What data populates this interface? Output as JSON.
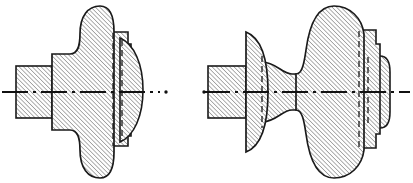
{
  "sheet": {
    "title": "Sectioned shaft assembly — two orthographic half-section views",
    "width": 413,
    "height": 183,
    "background_color": "#ffffff"
  },
  "style": {
    "outline_color": "#1a1a1a",
    "outline_width": 1.6,
    "hidden_line_color": "#1a1a1a",
    "hidden_line_width": 1.3,
    "hidden_line_dash": "6 4",
    "centerline_color": "#111111",
    "centerline_width": 2.2,
    "centerline_dash": "26 5 3 5",
    "hatch_color": "#3c3c3c",
    "hatch_width": 0.8,
    "hatch_spacing": 3.1,
    "hatch_angle_deg": 45,
    "fill_color": "#fefefe"
  },
  "figures": [
    {
      "id": "figure-left",
      "label": "Left view — shaft with round boss and end flange",
      "centerline": {
        "y": 92,
        "x_start": 2,
        "x_end": 160,
        "tail_dot_x": 166,
        "tail_dot_x2": 204
      },
      "parts": [
        {
          "name": "left-shaft-block",
          "kind": "rectangle",
          "description": "Rectangular shaft stub at left, sectioned",
          "x": 16,
          "y": 66,
          "width": 36,
          "height": 52
        },
        {
          "name": "central-round-boss",
          "kind": "lobed-boss",
          "description": "Large rounded central mass with concave fillets top and bottom",
          "x_left": 52,
          "x_right": 114,
          "y_top": 6,
          "y_bottom": 178
        },
        {
          "name": "right-step-block",
          "kind": "stepped-rectangle",
          "description": "Narrow stepped rectangular collar at right with hidden edges",
          "x": 114,
          "y": 32,
          "width": 16,
          "height": 114
        },
        {
          "name": "end-flange-lens",
          "kind": "lens-disc",
          "description": "Lens/disc shaped end flange overlapping the step block",
          "x_left": 118,
          "x_right": 143,
          "y_top": 38,
          "y_bottom": 142
        }
      ],
      "hidden_lines": [
        {
          "name": "hidden-edge-a",
          "x": 113,
          "y_top": 33,
          "y_bottom": 146
        },
        {
          "name": "hidden-edge-b",
          "x": 122,
          "y_top": 40,
          "y_bottom": 140
        }
      ]
    },
    {
      "id": "figure-right",
      "label": "Right view — shaft with D-flange, waisted neck and large end mass",
      "centerline": {
        "y": 92,
        "x_start": 204,
        "x_end": 410,
        "tail_dot_x": null,
        "tail_dot_x2": null
      },
      "parts": [
        {
          "name": "left-shaft-block",
          "kind": "rectangle",
          "description": "Rectangular shaft stub at left, sectioned",
          "x": 208,
          "y": 66,
          "width": 38,
          "height": 52
        },
        {
          "name": "d-flange-disc",
          "kind": "d-shape",
          "description": "D-shaped flange: flat left face, rounded right profile",
          "x_flat": 246,
          "x_bulge": 268,
          "y_top": 32,
          "y_bottom": 152
        },
        {
          "name": "waist-neck",
          "kind": "hourglass",
          "description": "Narrow waisted neck between flange and main mass",
          "x_left": 262,
          "x_right": 300,
          "y_top": 62,
          "y_bottom": 122
        },
        {
          "name": "main-body-mass",
          "kind": "lobed-boss",
          "description": "Large rounded main body, tallest element of the view",
          "x_left": 296,
          "x_right": 368,
          "y_top": 6,
          "y_bottom": 178
        },
        {
          "name": "right-collar-block",
          "kind": "stepped-rectangle",
          "description": "Stepped collar at right end with hidden edges",
          "x": 360,
          "y": 30,
          "width": 18,
          "height": 118
        },
        {
          "name": "end-boss-rounded",
          "kind": "rounded-rect",
          "description": "Small rounded rectangular boss at the extreme right end",
          "x": 368,
          "y": 56,
          "width": 22,
          "height": 72
        }
      ],
      "hidden_lines": [
        {
          "name": "hidden-edge-a",
          "x": 262,
          "y_top": 56,
          "y_bottom": 128
        },
        {
          "name": "hidden-edge-b",
          "x": 359,
          "y_top": 31,
          "y_bottom": 147
        },
        {
          "name": "hidden-edge-c",
          "x": 368,
          "y_top": 57,
          "y_bottom": 127
        }
      ]
    }
  ]
}
